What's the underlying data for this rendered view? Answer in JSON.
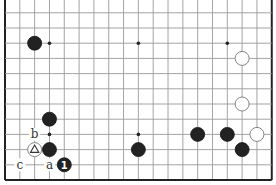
{
  "diagram": {
    "type": "go-board-partial",
    "columns": 19,
    "rows_shown": 12,
    "edges": {
      "left": true,
      "right": true,
      "bottom": true,
      "top": false
    },
    "geometry": {
      "x0": 5,
      "y_bottom": 180,
      "dx": 14.82,
      "dy": 15.2,
      "stone_radius": 7
    },
    "colors": {
      "black": "#222222",
      "white": "#ffffff",
      "grid": "#9a9a9a",
      "edge": "#222222"
    },
    "hoshi": [
      {
        "col": 4,
        "row": 10
      },
      {
        "col": 10,
        "row": 10
      },
      {
        "col": 16,
        "row": 10
      },
      {
        "col": 4,
        "row": 4
      },
      {
        "col": 10,
        "row": 4
      },
      {
        "col": 16,
        "row": 4
      }
    ],
    "stones": [
      {
        "color": "black",
        "col": 3,
        "row": 10
      },
      {
        "color": "white",
        "col": 17,
        "row": 9
      },
      {
        "color": "black",
        "col": 4,
        "row": 5
      },
      {
        "color": "white",
        "col": 3,
        "row": 3,
        "marker": "triangle"
      },
      {
        "color": "black",
        "col": 4,
        "row": 3
      },
      {
        "color": "black",
        "col": 5,
        "row": 2,
        "number": "1"
      },
      {
        "color": "black",
        "col": 10,
        "row": 3
      },
      {
        "color": "white",
        "col": 17,
        "row": 6
      },
      {
        "color": "black",
        "col": 14,
        "row": 4
      },
      {
        "color": "black",
        "col": 16,
        "row": 4
      },
      {
        "color": "white",
        "col": 18,
        "row": 4
      },
      {
        "color": "black",
        "col": 17,
        "row": 3
      }
    ],
    "labels": [
      {
        "text": "b",
        "col": 3,
        "row": 4
      },
      {
        "text": "a",
        "col": 4,
        "row": 2
      },
      {
        "text": "c",
        "col": 2,
        "row": 2
      }
    ]
  }
}
